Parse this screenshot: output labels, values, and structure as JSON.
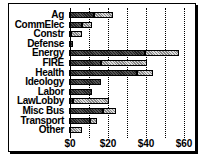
{
  "chart_data": {
    "type": "bar",
    "orientation": "horizontal",
    "stacked": true,
    "title": "",
    "xlabel": "",
    "ylabel": "",
    "categories": [
      "Ag",
      "CommElec",
      "Constr",
      "Defense",
      "Energy",
      "FIRE",
      "Health",
      "Ideology",
      "Labor",
      "LawLobby",
      "Misc Bus",
      "Transport",
      "Other"
    ],
    "series": [
      {
        "name": "Series 1 (dark)",
        "values": [
          13,
          7,
          1,
          2,
          40,
          17,
          36,
          17,
          12,
          2,
          18,
          11,
          0
        ]
      },
      {
        "name": "Series 2 (light)",
        "values": [
          10,
          5,
          6,
          0,
          18,
          24,
          8,
          0,
          0,
          19,
          7,
          4,
          7
        ]
      }
    ],
    "xticks": [
      "$0",
      "$20",
      "$40",
      "$60"
    ],
    "xlim": [
      0,
      62
    ],
    "grid": true,
    "gridlines_every": 10,
    "legend": null
  }
}
